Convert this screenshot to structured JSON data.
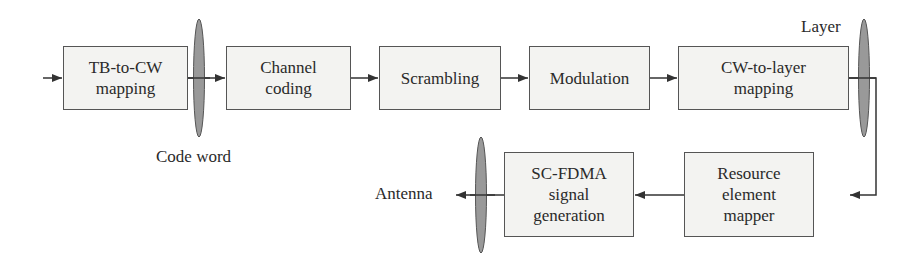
{
  "diagram": {
    "type": "block-diagram",
    "colors": {
      "box_fill": "#f3f3f1",
      "box_border": "#555555",
      "ellipse_fill": "#999999",
      "line": "#333333",
      "text": "#2a2a2a"
    },
    "blocks": [
      {
        "id": "tb-to-cw",
        "label": "TB-to-CW\nmapping"
      },
      {
        "id": "channel-coding",
        "label": "Channel\ncoding"
      },
      {
        "id": "scrambling",
        "label": "Scrambling"
      },
      {
        "id": "modulation",
        "label": "Modulation"
      },
      {
        "id": "cw-to-layer",
        "label": "CW-to-layer\nmapping"
      },
      {
        "id": "resource-element-mapper",
        "label": "Resource\nelement\nmapper"
      },
      {
        "id": "sc-fdma",
        "label": "SC-FDMA\nsignal\ngeneration"
      }
    ],
    "labels": {
      "code_word": "Code word",
      "layer": "Layer",
      "antenna": "Antenna"
    },
    "edges": [
      [
        "input",
        "tb-to-cw"
      ],
      [
        "tb-to-cw",
        "channel-coding"
      ],
      [
        "channel-coding",
        "scrambling"
      ],
      [
        "scrambling",
        "modulation"
      ],
      [
        "modulation",
        "cw-to-layer"
      ],
      [
        "cw-to-layer",
        "resource-element-mapper"
      ],
      [
        "resource-element-mapper",
        "sc-fdma"
      ],
      [
        "sc-fdma",
        "antenna"
      ]
    ]
  }
}
